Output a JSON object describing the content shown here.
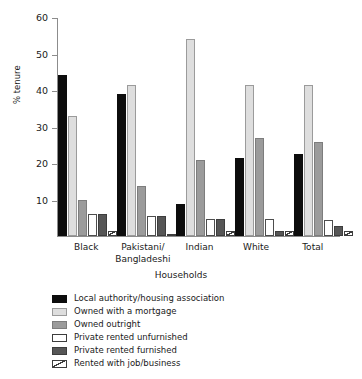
{
  "chart_data": {
    "type": "bar",
    "title": "",
    "subtitle": "",
    "xlabel": "Households",
    "ylabel": "% tenure",
    "ylim": [
      0,
      60
    ],
    "ytick_values": [
      10,
      20,
      30,
      40,
      50,
      60
    ],
    "ytick_labels": [
      "10",
      "20",
      "30",
      "40",
      "50",
      "60"
    ],
    "grid": false,
    "legend_position": "below-plot-left",
    "categories": [
      "Black",
      "Pakistani/\nBangladeshi",
      "Indian",
      "White",
      "Total"
    ],
    "category_labels": [
      {
        "line1": "Black",
        "line2": ""
      },
      {
        "line1": "Pakistani/",
        "line2": "Bangladeshi"
      },
      {
        "line1": "Indian",
        "line2": ""
      },
      {
        "line1": "White",
        "line2": ""
      },
      {
        "line1": "Total",
        "line2": ""
      }
    ],
    "series": [
      {
        "name": "Local authority/housing association",
        "color": "#0d0d0d",
        "values": [
          44.0,
          39.0,
          8.7,
          21.5,
          22.4
        ]
      },
      {
        "name": "Owned with a mortgage",
        "color": "#dedede",
        "values": [
          33.0,
          41.3,
          54.0,
          41.4,
          41.5
        ]
      },
      {
        "name": "Owned outright",
        "color": "#9b9b9b",
        "values": [
          10.0,
          13.6,
          20.9,
          26.9,
          25.7
        ]
      },
      {
        "name": "Private rented unfurnished",
        "color": "#ffffff",
        "values": [
          5.9,
          5.6,
          4.6,
          4.6,
          4.5
        ]
      },
      {
        "name": "Private rented furnished",
        "color": "#565656",
        "values": [
          5.9,
          5.6,
          4.6,
          1.3,
          2.7
        ]
      },
      {
        "name": "Rented with job/business",
        "color": "#ffffff-hatched",
        "values": [
          1.5,
          0.4,
          1.4,
          1.5,
          1.4
        ]
      }
    ]
  },
  "legend": {
    "items": [
      {
        "label": "Local authority/housing association",
        "swatch": "solid-black-swatch"
      },
      {
        "label": "Owned with a mortgage",
        "swatch": "light-gray-swatch"
      },
      {
        "label": "Owned outright",
        "swatch": "medium-gray-swatch"
      },
      {
        "label": "Private rented unfurnished",
        "swatch": "white-swatch"
      },
      {
        "label": "Private rented furnished",
        "swatch": "dark-gray-swatch"
      },
      {
        "label": "Rented with job/business",
        "swatch": "hatched-swatch"
      }
    ]
  }
}
